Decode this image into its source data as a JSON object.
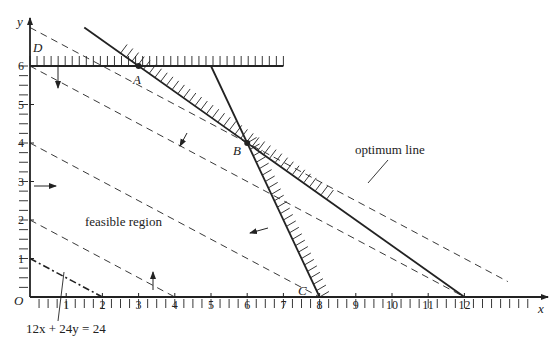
{
  "axes": {
    "x_label": "x",
    "y_label": "y",
    "origin_label": "O",
    "x_ticks": [
      "1",
      "2",
      "3",
      "4",
      "5",
      "6",
      "7",
      "8",
      "9",
      "10",
      "11",
      "12"
    ],
    "y_ticks": [
      "1",
      "2",
      "3",
      "4",
      "5",
      "6"
    ]
  },
  "points": {
    "A": {
      "label": "A",
      "x": 3,
      "y": 6
    },
    "B": {
      "label": "B",
      "x": 6,
      "y": 4
    },
    "C": {
      "label": "C",
      "x": 8,
      "y": 0
    },
    "D": {
      "label": "D",
      "x": 0,
      "y": 6
    }
  },
  "annotations": {
    "feasible_region": "feasible region",
    "optimum_line": "optimum line",
    "objective_equation": "12x + 24y = 24"
  },
  "constraints": [
    {
      "name": "y <= 6",
      "from": [
        0,
        6
      ],
      "to": [
        7,
        6
      ]
    },
    {
      "name": "2x + 3y <= 24",
      "from": [
        1.5,
        7
      ],
      "to": [
        12,
        0
      ]
    },
    {
      "name": "2x + y <= 16",
      "from": [
        5,
        6
      ],
      "to": [
        8,
        0
      ]
    }
  ],
  "objective_lines": [
    {
      "c": 24,
      "style": "dashdot"
    },
    {
      "c": 48,
      "style": "dashed"
    },
    {
      "c": 96,
      "style": "dashed"
    },
    {
      "c": 144,
      "style": "dashed"
    },
    {
      "c": 168,
      "style": "dashed",
      "optimum": true
    }
  ]
}
